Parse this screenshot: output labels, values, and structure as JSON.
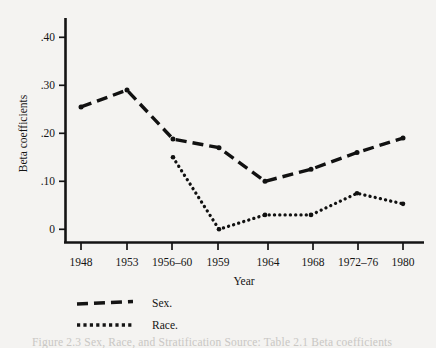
{
  "chart_data": {
    "type": "line",
    "title": "",
    "xlabel": "Year",
    "ylabel": "Beta coefficients",
    "categories": [
      "1948",
      "1953",
      "1956–60",
      "1959",
      "1964",
      "1968",
      "1972–76",
      "1980"
    ],
    "ylim": [
      0,
      0.44
    ],
    "yticks": [
      0,
      0.1,
      0.2,
      0.3,
      0.4
    ],
    "ytick_labels": [
      "0",
      ".10",
      ".20",
      ".30",
      ".40"
    ],
    "grid": false,
    "legend_position": "below-axes-left",
    "series": [
      {
        "name": "Sex.",
        "style": "dashed",
        "color": "#111111",
        "x": [
          "1948",
          "1953",
          "1956–60",
          "1959",
          "1964",
          "1968",
          "1972–76",
          "1980"
        ],
        "values": [
          0.255,
          0.29,
          0.188,
          0.17,
          0.1,
          0.125,
          0.16,
          0.19
        ]
      },
      {
        "name": "Race.",
        "style": "dotted",
        "color": "#111111",
        "x": [
          "1956–60",
          "1959",
          "1964",
          "1968",
          "1972–76",
          "1980"
        ],
        "values": [
          0.15,
          0.0,
          0.03,
          0.03,
          0.075,
          0.053
        ]
      }
    ]
  },
  "axes": {
    "y_axis_title": "Beta coefficients",
    "x_axis_title": "Year"
  },
  "legend": {
    "entries": [
      {
        "label": "Sex.",
        "style": "dashed"
      },
      {
        "label": "Race.",
        "style": "dotted"
      }
    ]
  },
  "caption": {
    "text": "Figure 2.3  Sex, Race, and Stratification Source: Table 2.1 Beta coefficients"
  }
}
